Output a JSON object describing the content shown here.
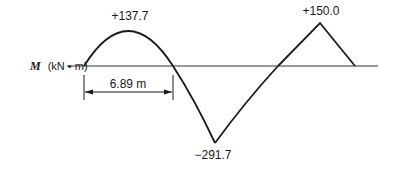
{
  "diagram": {
    "axis": {
      "symbol": "M",
      "units": "(kN • m)"
    },
    "values": {
      "max_positive_1": "+137.7",
      "max_negative": "−291.7",
      "max_positive_2": "+150.0"
    },
    "dimension": {
      "label": "6.89 m"
    },
    "colors": {
      "line": "#1a1a1a",
      "axis": "#333333",
      "background": "#ffffff"
    }
  }
}
